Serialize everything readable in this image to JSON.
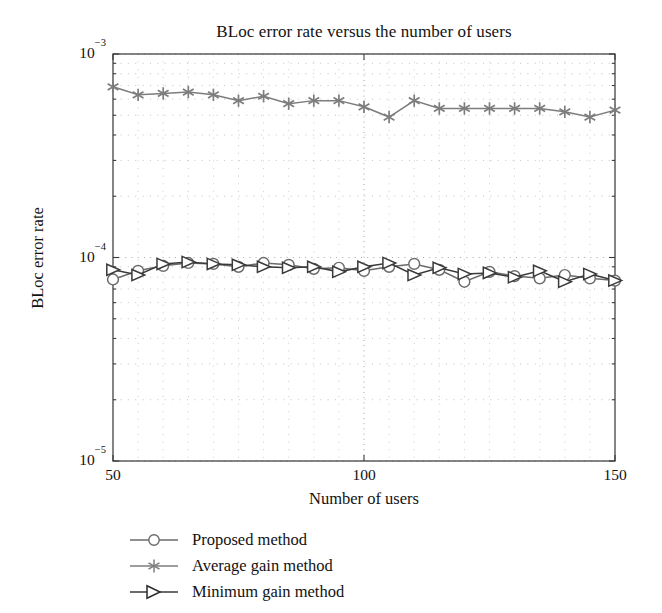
{
  "chart_data": {
    "type": "line",
    "title": "BLoc error rate versus the number of users",
    "xlabel": "Number of users",
    "ylabel": "BLoc error rate",
    "xscale": "linear",
    "yscale": "log",
    "xlim": [
      50,
      150
    ],
    "ylim": [
      1e-05,
      0.001
    ],
    "xticks": [
      50,
      100,
      150
    ],
    "xticklabels": [
      "50",
      "100",
      "150"
    ],
    "yticks": [
      1e-05,
      0.0001,
      0.001
    ],
    "yticklabels": [
      "10−5",
      "10−4",
      "10−3"
    ],
    "grid": "dotted minor and major gridlines on both axes",
    "legend_position": "below axes, lower left",
    "x": [
      50,
      55,
      60,
      65,
      70,
      75,
      80,
      85,
      90,
      95,
      100,
      105,
      110,
      115,
      120,
      125,
      130,
      135,
      140,
      145,
      150
    ],
    "series": [
      {
        "name": "Proposed method",
        "marker": "circle",
        "color": "#6b6b6b",
        "values": [
          7.8e-05,
          8.6e-05,
          9.1e-05,
          9.4e-05,
          9.3e-05,
          9e-05,
          9.4e-05,
          9.2e-05,
          8.8e-05,
          8.9e-05,
          8.6e-05,
          9e-05,
          9.3e-05,
          8.7e-05,
          7.6e-05,
          8.5e-05,
          8.1e-05,
          7.9e-05,
          8.2e-05,
          7.9e-05,
          7.7e-05
        ]
      },
      {
        "name": "Average gain method",
        "marker": "asterisk",
        "color": "#7d7d7d",
        "values": [
          0.00069,
          0.00063,
          0.00064,
          0.00065,
          0.00063,
          0.00059,
          0.00062,
          0.00057,
          0.00059,
          0.00059,
          0.00055,
          0.00049,
          0.00059,
          0.00054,
          0.00054,
          0.00054,
          0.00054,
          0.00054,
          0.00052,
          0.00049,
          0.00053
        ]
      },
      {
        "name": "Minimum gain method",
        "marker": "right-triangle",
        "color": "#3a3a3a",
        "values": [
          8.7e-05,
          8.2e-05,
          9.3e-05,
          9.5e-05,
          9.3e-05,
          9.2e-05,
          9e-05,
          8.9e-05,
          9e-05,
          8.5e-05,
          9e-05,
          9.4e-05,
          8.2e-05,
          8.9e-05,
          8.3e-05,
          8.4e-05,
          8e-05,
          8.6e-05,
          7.6e-05,
          8.3e-05,
          7.7e-05
        ]
      }
    ]
  },
  "legend": {
    "items": [
      {
        "label": "Proposed method",
        "marker": "circle"
      },
      {
        "label": "Average gain method",
        "marker": "asterisk"
      },
      {
        "label": "Minimum gain method",
        "marker": "right-triangle"
      }
    ]
  }
}
